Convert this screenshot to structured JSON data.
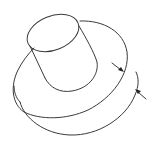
{
  "diagram": {
    "type": "isometric-line-drawing",
    "colors": {
      "background": "#ffffff",
      "line": "#3a3a3a",
      "arrow": "#222222"
    },
    "parts": [
      {
        "name": "boss-cylinder",
        "description": "small upright cylinder"
      },
      {
        "name": "base-disc",
        "description": "large flat disc below the boss"
      }
    ],
    "annotations": [
      {
        "name": "arrow-inner",
        "points_to": "top edge of base disc"
      },
      {
        "name": "arrow-outer",
        "points_to": "bottom edge of base disc"
      }
    ]
  }
}
